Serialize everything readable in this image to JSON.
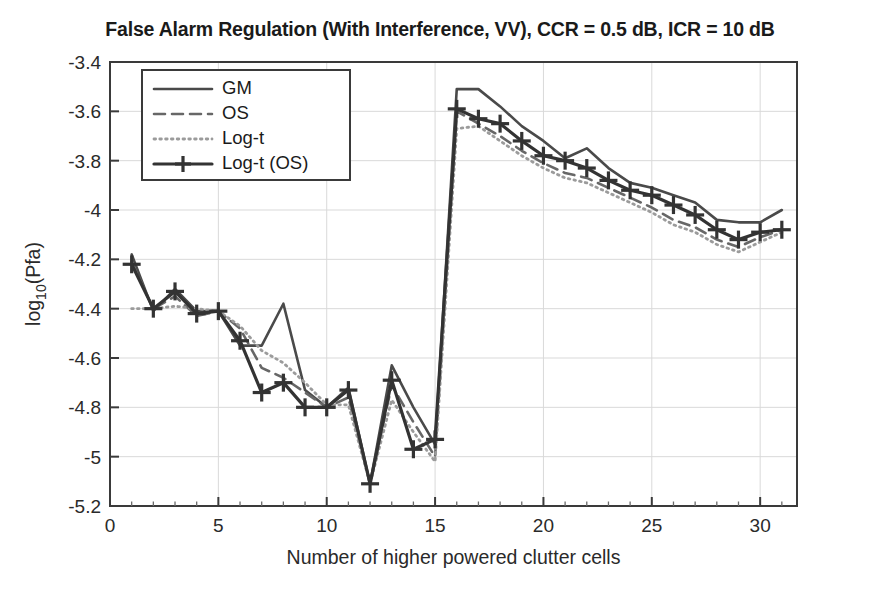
{
  "chart_data": {
    "type": "line",
    "title": "False Alarm Regulation (With Interference, VV), CCR = 0.5 dB, ICR = 10 dB",
    "xlabel": "Number of higher powered clutter cells",
    "ylabel": "log_10(Pfa)",
    "ylabel_base": "log",
    "ylabel_sub": "10",
    "ylabel_rest": "(Pfa)",
    "xlim": [
      0,
      31.7
    ],
    "ylim": [
      -5.2,
      -3.4
    ],
    "xticks": [
      0,
      5,
      10,
      15,
      20,
      25,
      30
    ],
    "xticklabels": [
      "0",
      "5",
      "10",
      "15",
      "20",
      "25",
      "30"
    ],
    "yticks": [
      -3.4,
      -3.6,
      -3.8,
      -4,
      -4.2,
      -4.4,
      -4.6,
      -4.8,
      -5,
      -5.2
    ],
    "yticklabels": [
      "-3.4",
      "-3.6",
      "-3.8",
      "-4",
      "-4.2",
      "-4.4",
      "-4.6",
      "-4.8",
      "-5",
      "-5.2"
    ],
    "grid": true,
    "grid_color": "#d9d9d9",
    "legend_position": "upper left",
    "x": [
      1,
      2,
      3,
      4,
      5,
      6,
      7,
      8,
      9,
      10,
      11,
      12,
      13,
      14,
      15,
      16,
      17,
      18,
      19,
      20,
      21,
      22,
      23,
      24,
      25,
      26,
      27,
      28,
      29,
      30,
      31
    ],
    "series": [
      {
        "name": "GM",
        "style": "solid",
        "color": "#4a4a4a",
        "width": 2.6,
        "marker": "none",
        "values": [
          -4.18,
          -4.41,
          -4.32,
          -4.41,
          -4.41,
          -4.55,
          -4.55,
          -4.38,
          -4.73,
          -4.8,
          -4.72,
          -5.11,
          -4.63,
          -4.8,
          -4.95,
          -3.51,
          -3.51,
          -3.58,
          -3.66,
          -3.72,
          -3.79,
          -3.75,
          -3.83,
          -3.89,
          -3.91,
          -3.94,
          -3.97,
          -4.04,
          -4.05,
          -4.05,
          -4.0
        ]
      },
      {
        "name": "OS",
        "style": "dashed",
        "color": "#676767",
        "width": 2.6,
        "marker": "none",
        "values": [
          -4.21,
          -4.4,
          -4.35,
          -4.43,
          -4.41,
          -4.48,
          -4.64,
          -4.68,
          -4.74,
          -4.8,
          -4.76,
          -5.11,
          -4.71,
          -4.86,
          -5.0,
          -3.6,
          -3.65,
          -3.7,
          -3.76,
          -3.81,
          -3.85,
          -3.87,
          -3.91,
          -3.95,
          -3.99,
          -4.04,
          -4.07,
          -4.12,
          -4.15,
          -4.11,
          -4.08
        ]
      },
      {
        "name": "Log-t",
        "style": "dotted",
        "color": "#9b9b9b",
        "width": 2.8,
        "marker": "none",
        "values": [
          -4.4,
          -4.4,
          -4.39,
          -4.4,
          -4.41,
          -4.47,
          -4.57,
          -4.62,
          -4.7,
          -4.79,
          -4.79,
          -5.11,
          -4.77,
          -4.9,
          -5.02,
          -3.67,
          -3.66,
          -3.72,
          -3.78,
          -3.83,
          -3.87,
          -3.89,
          -3.93,
          -3.97,
          -4.01,
          -4.06,
          -4.09,
          -4.14,
          -4.17,
          -4.13,
          -4.09
        ]
      },
      {
        "name": "Log-t (OS)",
        "style": "solid-marker",
        "color": "#333333",
        "width": 3.2,
        "marker": "plus",
        "values": [
          -4.22,
          -4.4,
          -4.33,
          -4.42,
          -4.41,
          -4.53,
          -4.74,
          -4.7,
          -4.8,
          -4.8,
          -4.73,
          -5.11,
          -4.69,
          -4.97,
          -4.93,
          -3.59,
          -3.63,
          -3.65,
          -3.72,
          -3.78,
          -3.8,
          -3.83,
          -3.88,
          -3.92,
          -3.94,
          -3.98,
          -4.02,
          -4.08,
          -4.12,
          -4.09,
          -4.08
        ]
      }
    ]
  },
  "legend": {
    "items": [
      {
        "label": "GM"
      },
      {
        "label": "OS"
      },
      {
        "label": "Log-t"
      },
      {
        "label": "Log-t (OS)"
      }
    ]
  }
}
